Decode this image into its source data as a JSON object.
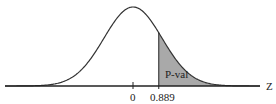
{
  "chart_data": {
    "type": "area",
    "title": "",
    "xlabel": "Z",
    "ylabel": "",
    "x_ticks": [
      "0",
      "0.889"
    ],
    "distribution": {
      "name": "standard normal",
      "mean": 0,
      "sd": 1
    },
    "shaded_region": {
      "from": 0.889,
      "to": "inf",
      "label": "P-val",
      "fill_color": "#a9a9a9"
    },
    "xlim": [
      -3.6,
      3.6
    ],
    "grid": false,
    "legend": null
  },
  "labels": {
    "axis_name": "Z",
    "tick_zero": "0",
    "tick_cutoff": "0.889",
    "region": "P-val"
  },
  "colors": {
    "curve": "#333333",
    "shade": "#a9a9a9",
    "axis": "#222222"
  }
}
